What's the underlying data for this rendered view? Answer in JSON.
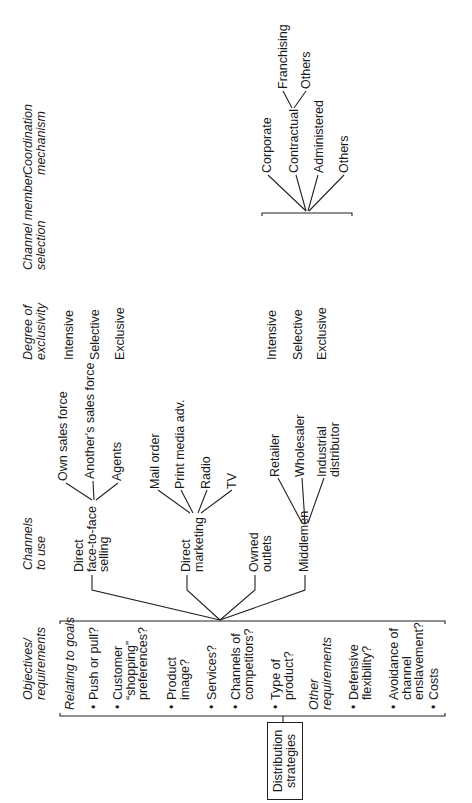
{
  "headers": {
    "objectives": [
      "Objectives/",
      "requirements"
    ],
    "channels": [
      "Channels",
      "to use"
    ],
    "exclusivity": [
      "Degree of",
      "exclusivity"
    ],
    "member_selection": [
      "Channel member",
      "selection"
    ],
    "coordination": [
      "Coordination",
      "mechanism"
    ]
  },
  "root_box": [
    "Distribution",
    "strategies"
  ],
  "objectives": {
    "goals_heading": "Relating to goals",
    "goals": [
      [
        "Push or pull?"
      ],
      [
        "Customer",
        "“shopping”",
        "preferences?"
      ],
      [
        "Product",
        "image?"
      ],
      [
        "Services?"
      ],
      [
        "Channels of",
        "competitors?"
      ],
      [
        "Type of",
        "product?"
      ]
    ],
    "other_heading": [
      "Other",
      "requirements"
    ],
    "other": [
      [
        "Defensive",
        "flexibility?"
      ],
      [
        "Avoidance of",
        "channel",
        "enslavement?"
      ],
      [
        "Costs"
      ]
    ]
  },
  "channels": [
    {
      "label": [
        "Direct",
        "face-to-face",
        "selling"
      ],
      "subchannels": [
        [
          "Own sales force"
        ],
        [
          "Another's sales force"
        ],
        [
          "Agents"
        ]
      ],
      "exclusivity": [
        "Intensive",
        "Selective",
        "Exclusive"
      ]
    },
    {
      "label": [
        "Direct",
        "marketing"
      ],
      "subchannels": [
        [
          "Mail order"
        ],
        [
          "Print media adv."
        ],
        [
          "Radio"
        ],
        [
          "TV"
        ]
      ]
    },
    {
      "label": [
        "Owned",
        "outlets"
      ],
      "subchannels": []
    },
    {
      "label": [
        "Middlemen"
      ],
      "subchannels": [
        [
          "Retailer"
        ],
        [
          "Wholesaler"
        ],
        [
          "Industrial",
          "distributor"
        ]
      ],
      "exclusivity": [
        "Intensive",
        "Selective",
        "Exclusive"
      ],
      "coordination": {
        "options": [
          "Corporate",
          "Contractual",
          "Administered",
          "Others"
        ],
        "contractual_options": [
          "Franchising",
          "Others"
        ]
      }
    }
  ]
}
